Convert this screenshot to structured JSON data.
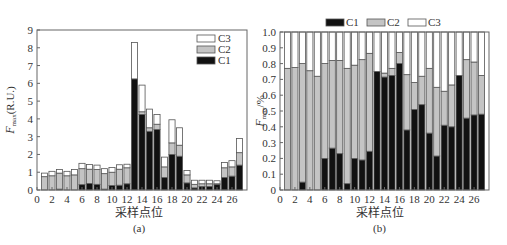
{
  "chart_data": [
    {
      "id": "a",
      "type": "bar",
      "stacked": true,
      "caption": "(a)",
      "xlabel": "采样点位",
      "ylabel": "F_max(R.U.)",
      "ylabel_main": "F",
      "ylabel_sub": "max",
      "ylabel_unit": "(R.U.)",
      "ylim": [
        0,
        9
      ],
      "yticks": [
        0,
        1,
        2,
        3,
        4,
        5,
        6,
        7,
        8,
        9
      ],
      "xlim": [
        0,
        28
      ],
      "xticks": [
        0,
        2,
        4,
        6,
        8,
        10,
        12,
        14,
        16,
        18,
        20,
        22,
        24,
        26
      ],
      "legend_position": "upper right (inside)",
      "legend": [
        "C3",
        "C2",
        "C1"
      ],
      "categories": [
        1,
        2,
        3,
        4,
        5,
        6,
        7,
        8,
        9,
        10,
        11,
        12,
        13,
        14,
        15,
        16,
        17,
        18,
        19,
        20,
        21,
        22,
        23,
        24,
        25,
        26,
        27
      ],
      "series": [
        {
          "name": "C1",
          "color": "#111111",
          "values": [
            0,
            0,
            0.05,
            0,
            0,
            0.3,
            0.37,
            0.32,
            0.05,
            0.25,
            0.27,
            0.35,
            6.25,
            4.25,
            3.3,
            3.4,
            0.7,
            2.0,
            1.9,
            0.4,
            0.12,
            0.2,
            0.2,
            0.3,
            0.7,
            0.78,
            1.4
          ]
        },
        {
          "name": "C2",
          "color": "#c4c4c4",
          "values": [
            0.75,
            0.8,
            0.9,
            0.8,
            0.85,
            0.9,
            0.8,
            0.83,
            0.87,
            0.75,
            0.9,
            0.9,
            0,
            0.15,
            0.2,
            0.3,
            0.6,
            0.65,
            0.62,
            0.45,
            0.2,
            0.15,
            0.15,
            0.05,
            0.55,
            0.52,
            0.7
          ]
        },
        {
          "name": "C3",
          "color": "#ffffff",
          "values": [
            0.2,
            0.25,
            0.2,
            0.25,
            0.3,
            0.3,
            0.27,
            0.25,
            0.28,
            0.27,
            0.25,
            0.2,
            2.05,
            1.5,
            1.05,
            0.55,
            0.55,
            1.3,
            0.98,
            0.25,
            0.23,
            0.2,
            0.2,
            0.17,
            0.3,
            0.35,
            0.8
          ]
        }
      ],
      "grid": false
    },
    {
      "id": "b",
      "type": "bar",
      "stacked": true,
      "caption": "(b)",
      "xlabel": "采样点位",
      "ylabel": "F_max/%",
      "ylabel_main": "F",
      "ylabel_sub": "max",
      "ylabel_unit": "/%",
      "ylim": [
        0,
        1.0
      ],
      "yticks": [
        "0",
        "0.1",
        "0.2",
        "0.3",
        "0.4",
        "0.5",
        "0.6",
        "0.7",
        "0.8",
        "0.9",
        "1.0"
      ],
      "xlim": [
        0,
        28
      ],
      "xticks": [
        0,
        2,
        4,
        6,
        8,
        10,
        12,
        14,
        16,
        18,
        20,
        22,
        24,
        26
      ],
      "legend_position": "top (outside)",
      "legend": [
        "C1",
        "C2",
        "C3"
      ],
      "categories": [
        1,
        2,
        3,
        4,
        5,
        6,
        7,
        8,
        9,
        10,
        11,
        12,
        13,
        14,
        15,
        16,
        17,
        18,
        19,
        20,
        21,
        22,
        23,
        24,
        25,
        26,
        27
      ],
      "series": [
        {
          "name": "C1",
          "color": "#111111",
          "values": [
            0,
            0,
            0.05,
            0,
            0,
            0.2,
            0.265,
            0.23,
            0.04,
            0.2,
            0.19,
            0.245,
            0.75,
            0.715,
            0.725,
            0.8,
            0.38,
            0.51,
            0.54,
            0.36,
            0.215,
            0.41,
            0.4,
            0.725,
            0.455,
            0.475,
            0.48
          ]
        },
        {
          "name": "C2",
          "color": "#c4c4c4",
          "values": [
            0.77,
            0.775,
            0.75,
            0.755,
            0.72,
            0.6,
            0.555,
            0.59,
            0.73,
            0.59,
            0.635,
            0.62,
            0,
            0.025,
            0.045,
            0.07,
            0.35,
            0.17,
            0.18,
            0.41,
            0.435,
            0.215,
            0.265,
            0,
            0.37,
            0.335,
            0.245
          ]
        },
        {
          "name": "C3",
          "color": "#ffffff",
          "values": [
            0.23,
            0.225,
            0.2,
            0.245,
            0.28,
            0.2,
            0.18,
            0.18,
            0.23,
            0.21,
            0.175,
            0.135,
            0.25,
            0.26,
            0.23,
            0.13,
            0.27,
            0.32,
            0.28,
            0.23,
            0.35,
            0.375,
            0.335,
            0.275,
            0.175,
            0.19,
            0.275
          ]
        }
      ],
      "grid": false
    }
  ]
}
